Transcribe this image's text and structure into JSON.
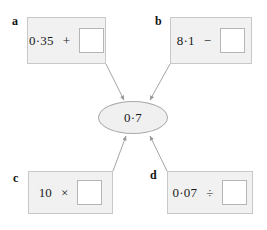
{
  "worksheet": {
    "target": {
      "value": "0·7",
      "shape": "ellipse",
      "fill_color": "#f0f0f0",
      "border_color": "#a9a9a9"
    },
    "cards": [
      {
        "label": "a",
        "operand": "0·35",
        "operator": "+",
        "operator_name": "plus-sign",
        "answer": "",
        "fill_color": "#f1f1f1"
      },
      {
        "label": "b",
        "operand": "8·1",
        "operator": "−",
        "operator_name": "minus-sign",
        "answer": "",
        "fill_color": "#f1f1f1"
      },
      {
        "label": "c",
        "operand": "10",
        "operator": "×",
        "operator_name": "multiplication-sign",
        "answer": "",
        "fill_color": "#f1f1f1"
      },
      {
        "label": "d",
        "operand": "0·07",
        "operator": "÷",
        "operator_name": "division-sign",
        "answer": "",
        "fill_color": "#f1f1f1"
      }
    ],
    "arrows": {
      "count": 4,
      "direction": "cards-to-target",
      "color": "#9a9a9a"
    }
  }
}
